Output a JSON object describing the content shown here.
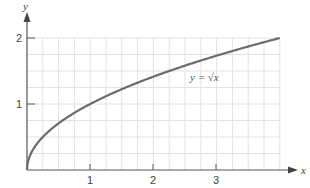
{
  "chart_data": {
    "type": "line",
    "title": "",
    "xlabel": "x",
    "ylabel": "y",
    "xlim": [
      0,
      4
    ],
    "ylim": [
      0,
      2
    ],
    "x_ticks": [
      "1",
      "2",
      "3"
    ],
    "y_ticks": [
      "1",
      "2"
    ],
    "grid": true,
    "grid_step_x": 0.25,
    "grid_step_y": 0.25,
    "series": [
      {
        "name": "y = √x",
        "function": "sqrt(x)",
        "x": [
          0,
          0.0625,
          0.25,
          0.5,
          1,
          1.5,
          2,
          2.5,
          3,
          3.5,
          4
        ],
        "y": [
          0,
          0.25,
          0.5,
          0.707,
          1,
          1.225,
          1.414,
          1.581,
          1.732,
          1.871,
          2
        ]
      }
    ],
    "annotations": [
      {
        "text": "y = √x",
        "x": 2.7,
        "y": 1.4
      }
    ],
    "colors": {
      "curve": "#6b6b6b",
      "grid": "#e2e2e2",
      "axis": "#555555"
    }
  }
}
